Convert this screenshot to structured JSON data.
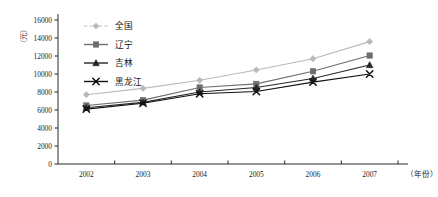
{
  "chart_data": {
    "type": "line",
    "title": "",
    "subtitle": "",
    "xlabel": "（年份）",
    "ylabel": "（元）",
    "x": [
      "2002",
      "2003",
      "2004",
      "2005",
      "2006",
      "2007"
    ],
    "categories": [
      "2002",
      "2003",
      "2004",
      "2005",
      "2006",
      "2007"
    ],
    "ylim": [
      0,
      16000
    ],
    "yticks": [
      0,
      2000,
      4000,
      6000,
      8000,
      10000,
      12000,
      14000,
      16000
    ],
    "ytick_labels": [
      "0",
      "2000",
      "4000",
      "6000",
      "8000",
      "10000",
      "12000",
      "14000",
      "16000"
    ],
    "grid": false,
    "legend_position": "top-left-inside",
    "series": [
      {
        "name": "全国",
        "marker": "diamond",
        "line_style": "dashed",
        "color": "#b9b9b9",
        "values": [
          7700,
          8400,
          9300,
          10450,
          11700,
          13600
        ]
      },
      {
        "name": "辽宁",
        "marker": "square",
        "line_style": "solid",
        "color": "#6e6e6e",
        "values": [
          6500,
          7100,
          8500,
          8900,
          10300,
          12050
        ]
      },
      {
        "name": "吉林",
        "marker": "triangle",
        "line_style": "solid",
        "color": "#262626",
        "values": [
          6250,
          6850,
          8000,
          8500,
          9500,
          11000
        ]
      },
      {
        "name": "黑龙江",
        "marker": "cross",
        "line_style": "solid",
        "color": "#111111",
        "values": [
          6100,
          6750,
          7800,
          8050,
          9100,
          10000
        ]
      }
    ]
  }
}
